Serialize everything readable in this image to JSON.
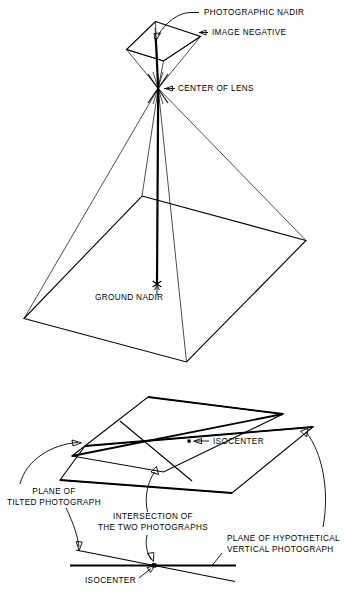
{
  "figure": {
    "title_present": false,
    "background_color": "#ffffff",
    "stroke_color": "#000000",
    "type": "technical-line-diagram",
    "panels": [
      {
        "id": "upper",
        "name": "tilted-photograph-perspective-pyramid",
        "labels": [
          {
            "id": "photographic-nadir",
            "text": "PHOTOGRAPHIC NADIR",
            "x": 204,
            "y": 15
          },
          {
            "id": "image-negative",
            "text": "IMAGE NEGATIVE",
            "x": 212,
            "y": 35
          },
          {
            "id": "center-of-lens",
            "text": "CENTER OF LENS",
            "x": 178,
            "y": 91
          },
          {
            "id": "ground-nadir",
            "text": "GROUND NADIR",
            "x": 95,
            "y": 300
          }
        ]
      },
      {
        "id": "lower",
        "name": "intersection-of-tilted-and-vertical-photograph-planes",
        "labels": [
          {
            "id": "isocenter-upper",
            "text": "ISOCENTER",
            "x": 213,
            "y": 442
          },
          {
            "id": "plane-of-tilted-photograph-line1",
            "text": "PLANE OF",
            "x": 52,
            "y": 491
          },
          {
            "id": "plane-of-tilted-photograph-line2",
            "text": "TILTED PHOTOGRAPH",
            "x": 52,
            "y": 502
          },
          {
            "id": "intersection-line1",
            "text": "INTERSECTION OF",
            "x": 152,
            "y": 518
          },
          {
            "id": "intersection-line2",
            "text": "THE TWO PHOTOGRAPHS",
            "x": 152,
            "y": 529
          },
          {
            "id": "plane-of-hypothetical-line1",
            "text": "PLANE OF HYPOTHETICAL",
            "x": 228,
            "y": 540
          },
          {
            "id": "plane-of-hypothetical-line2",
            "text": "VERTICAL PHOTOGRAPH",
            "x": 228,
            "y": 551
          },
          {
            "id": "isocenter-lower",
            "text": "ISOCENTER",
            "x": 92,
            "y": 580
          }
        ]
      }
    ]
  }
}
